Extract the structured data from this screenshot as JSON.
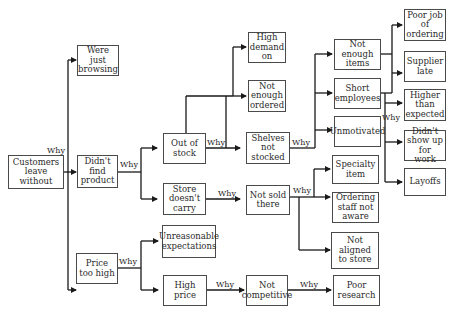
{
  "diagram": {
    "type": "five-whys tree",
    "edge_label": "Why",
    "colors": {
      "line": "#1a1a1a",
      "box_border": "#4a4a4a",
      "text": "#2a2a2a"
    },
    "nodes": {
      "root": "Customers leave without",
      "browsing": "Were just browsing",
      "didnt_find": "Didn't find product",
      "price_high": "Price too high",
      "out_of_stock": "Out of stock",
      "store_doesnt_carry": "Store doesn't carry",
      "high_demand": "High demand on",
      "not_enough_ordered": "Not enough ordered",
      "shelves_not_stocked": "Shelves not stocked",
      "not_sold_there": "Not sold there",
      "unreasonable": "Unreasonable expectations",
      "high_price": "High price",
      "not_competitive": "Not competitive",
      "poor_research": "Poor research",
      "not_enough_items": "Not enough items",
      "short_employees": "Short employees",
      "unmotivated": "Unmotivated",
      "specialty_item": "Specialty item",
      "ordering_staff": "Ordering staff not aware",
      "not_aligned": "Not aligned to store",
      "poor_job": "Poor job of ordering",
      "supplier_late": "Supplier late",
      "higher_expected": "Higher than expected",
      "didnt_show": "Didn't show up for work",
      "layoffs": "Layoffs"
    },
    "why_labels": {
      "root": "Why",
      "didnt_find": "Why",
      "out_of_stock": "Why",
      "store_doesnt_carry": "Why",
      "shelves": "Why",
      "not_sold": "Why",
      "price_high": "Why",
      "high_price": "Why",
      "not_competitive": "Why",
      "employees": "Why"
    }
  }
}
